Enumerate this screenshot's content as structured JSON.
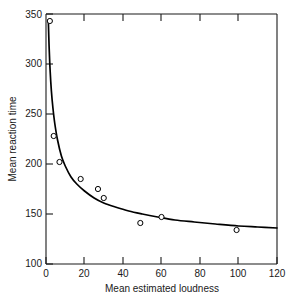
{
  "chart_data": {
    "type": "scatter",
    "title": "",
    "xlabel": "Mean estimated loudness",
    "ylabel": "Mean reaction time",
    "xlim": [
      0,
      120
    ],
    "ylim": [
      100,
      350
    ],
    "xticks": [
      0,
      20,
      40,
      60,
      80,
      100,
      120
    ],
    "yticks": [
      100,
      150,
      200,
      250,
      300,
      350
    ],
    "xtick_labels": [
      "0",
      "20",
      "40",
      "60",
      "80",
      "100",
      "120"
    ],
    "ytick_labels": [
      "100",
      "150",
      "200",
      "250",
      "300",
      "350"
    ],
    "grid": false,
    "legend": null,
    "marker": "open-circle",
    "series": [
      {
        "name": "Mean reaction time vs mean estimated loudness",
        "x": [
          2,
          4,
          7,
          18,
          27,
          30,
          49,
          60,
          99
        ],
        "y": [
          343,
          228,
          202,
          185,
          175,
          166,
          141,
          147,
          134
        ]
      }
    ],
    "fit_curve": {
      "description": "decreasing power-function fit through the data",
      "x": [
        1.2,
        1.6,
        2.1,
        2.8,
        3.6,
        4.6,
        6,
        8,
        10,
        13,
        16,
        20,
        25,
        30,
        36,
        43,
        50,
        58,
        67,
        77,
        88,
        100,
        110,
        120
      ],
      "y": [
        344,
        318,
        295,
        273,
        256,
        240,
        224,
        208,
        198,
        187,
        180,
        173,
        166,
        161,
        157,
        153,
        150,
        147,
        144,
        142,
        140,
        138,
        137,
        136
      ]
    },
    "colors": {
      "axis": "#1a1a1a",
      "curve": "#000000",
      "marker_edge": "#000000",
      "marker_fill": "#ffffff",
      "background": "#ffffff"
    }
  }
}
